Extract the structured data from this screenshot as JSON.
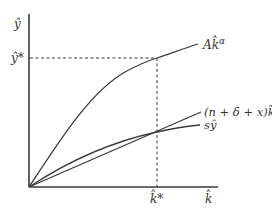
{
  "diagram": {
    "type": "solow-growth-steady-state",
    "axes": {
      "y_label": "ŷ",
      "x_label": "k̂"
    },
    "steady_state": {
      "y_label": "ŷ*",
      "k_label": "k̂*"
    },
    "curves": [
      {
        "id": "production",
        "label_main": "Ak̂",
        "label_sup": "α"
      },
      {
        "id": "break-even",
        "label": "(n + δ + x)k̂"
      },
      {
        "id": "saving",
        "label": "sŷ"
      }
    ],
    "colors": {
      "line": "#3a3a3a",
      "text": "#333333",
      "background": "#ffffff"
    }
  }
}
